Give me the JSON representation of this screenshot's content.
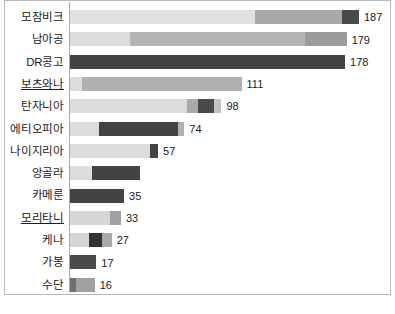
{
  "chart": {
    "type": "bar",
    "orientation": "horizontal",
    "stacked": true,
    "title": "",
    "xlabel": "",
    "ylabel": "",
    "grid": false,
    "legend": "none",
    "axis_min": 0,
    "axis_max": 187
  },
  "palette": {
    "very_light": "#e3e3e3",
    "light": "#d6d6d6",
    "light_medium": "#c9c9c9",
    "medium": "#a9a9a9",
    "medium_dark": "#949494",
    "dark": "#4a4a4a",
    "darkest": "#3b3b3b",
    "frame": "#b9b9b9",
    "axis": "#a8a8a8",
    "text": "#1c1c1c",
    "background": "#ffffff"
  },
  "chart_data": {
    "type": "bar",
    "orientation": "horizontal",
    "stacked": true,
    "title": "",
    "xlabel": "",
    "ylabel": "",
    "grid": false,
    "legend": "none",
    "xlim": [
      0,
      187
    ],
    "categories": [
      "모잠비크",
      "남아공",
      "DR콩고",
      "보츠와나",
      "탄자니아",
      "에티오피아",
      "나이지리아",
      "앙골라",
      "카메룬",
      "모리타니",
      "케나",
      "가봉",
      "수단"
    ],
    "totals": [
      187,
      179,
      178,
      111,
      98,
      74,
      57,
      null,
      35,
      33,
      27,
      17,
      16
    ],
    "value_labels": [
      "187",
      "179",
      "178",
      "111",
      "98",
      "74",
      "57",
      "",
      "35",
      "33",
      "27",
      "17",
      "16"
    ],
    "rows": [
      {
        "category": "모잠비크",
        "total": 187,
        "label": "187",
        "underlined": false,
        "segments": [
          {
            "value": 120,
            "color": "#e0e0e0"
          },
          {
            "value": 56,
            "color": "#a9a9a9"
          },
          {
            "value": 11,
            "color": "#4a4a4a"
          }
        ]
      },
      {
        "category": "남아공",
        "total": 179,
        "label": "179",
        "underlined": false,
        "segments": [
          {
            "value": 39,
            "color": "#dcdcdc"
          },
          {
            "value": 113,
            "color": "#b5b5b5"
          },
          {
            "value": 27,
            "color": "#9b9b9b"
          }
        ]
      },
      {
        "category": "DR콩고",
        "total": 178,
        "label": "178",
        "underlined": false,
        "segments": [
          {
            "value": 178,
            "color": "#434343"
          }
        ]
      },
      {
        "category": "보츠와나",
        "total": 111,
        "label": "111",
        "underlined": true,
        "segments": [
          {
            "value": 8,
            "color": "#dcdcdc"
          },
          {
            "value": 103,
            "color": "#b0b0b0"
          }
        ]
      },
      {
        "category": "탄자니아",
        "total": 98,
        "label": "98",
        "underlined": false,
        "segments": [
          {
            "value": 76,
            "color": "#dcdcdc"
          },
          {
            "value": 7,
            "color": "#a9a9a9"
          },
          {
            "value": 10,
            "color": "#4a4a4a"
          },
          {
            "value": 5,
            "color": "#c2c2c2"
          }
        ]
      },
      {
        "category": "에티오피아",
        "total": 74,
        "label": "74",
        "underlined": false,
        "segments": [
          {
            "value": 19,
            "color": "#dcdcdc"
          },
          {
            "value": 51,
            "color": "#434343"
          },
          {
            "value": 4,
            "color": "#b0b0b0"
          }
        ]
      },
      {
        "category": "나이지리아",
        "total": 57,
        "label": "57",
        "underlined": false,
        "segments": [
          {
            "value": 52,
            "color": "#dcdcdc"
          },
          {
            "value": 5,
            "color": "#434343"
          }
        ]
      },
      {
        "category": "앙골라",
        "total": null,
        "label": "",
        "underlined": false,
        "segments": [
          {
            "value": 14,
            "color": "#dcdcdc"
          },
          {
            "value": 31,
            "color": "#434343"
          }
        ]
      },
      {
        "category": "카메룬",
        "total": 35,
        "label": "35",
        "underlined": false,
        "segments": [
          {
            "value": 35,
            "color": "#434343"
          }
        ]
      },
      {
        "category": "모리타니",
        "total": 33,
        "label": "33",
        "underlined": true,
        "segments": [
          {
            "value": 26,
            "color": "#d6d6d6"
          },
          {
            "value": 7,
            "color": "#a0a0a0"
          }
        ]
      },
      {
        "category": "케나",
        "total": 27,
        "label": "27",
        "underlined": false,
        "segments": [
          {
            "value": 12,
            "color": "#d6d6d6"
          },
          {
            "value": 9,
            "color": "#333333"
          },
          {
            "value": 6,
            "color": "#a9a9a9"
          }
        ]
      },
      {
        "category": "가봉",
        "total": 17,
        "label": "17",
        "underlined": false,
        "segments": [
          {
            "value": 17,
            "color": "#4a4a4a"
          }
        ]
      },
      {
        "category": "수단",
        "total": 16,
        "label": "16",
        "underlined": false,
        "segments": [
          {
            "value": 4,
            "color": "#6e6e6e"
          },
          {
            "value": 12,
            "color": "#a0a0a0"
          }
        ]
      }
    ]
  }
}
